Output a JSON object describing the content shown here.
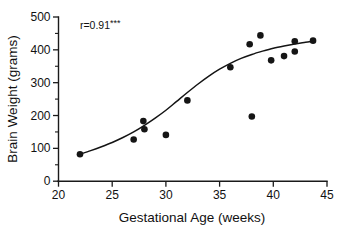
{
  "chart_data": {
    "type": "scatter",
    "title": "",
    "xlabel": "Gestational Age (weeks)",
    "ylabel": "Brain Weight (grams)",
    "xlim": [
      20,
      45
    ],
    "ylim": [
      0,
      500
    ],
    "xticks": [
      20,
      25,
      30,
      35,
      40,
      45
    ],
    "xtick_labels": [
      "20",
      "25",
      "30",
      "35",
      "40",
      "45"
    ],
    "yticks": [
      0,
      100,
      200,
      300,
      400,
      500
    ],
    "ytick_labels": [
      "0",
      "100",
      "200",
      "300",
      "400",
      "500"
    ],
    "y_minor_ticks": [
      50,
      150,
      250,
      350,
      450
    ],
    "x_minor_ticks": [],
    "grid": false,
    "legend": false,
    "annotations": [
      {
        "name": "correlation-annotation",
        "text": "r=0.91",
        "superscript": "***",
        "x": 22.0,
        "y": 462
      }
    ],
    "points": [
      {
        "x": 22.0,
        "y": 82
      },
      {
        "x": 27.0,
        "y": 127
      },
      {
        "x": 27.9,
        "y": 183
      },
      {
        "x": 28.0,
        "y": 158
      },
      {
        "x": 30.0,
        "y": 141
      },
      {
        "x": 32.0,
        "y": 246
      },
      {
        "x": 36.0,
        "y": 347
      },
      {
        "x": 37.8,
        "y": 417
      },
      {
        "x": 38.0,
        "y": 197
      },
      {
        "x": 38.8,
        "y": 444
      },
      {
        "x": 39.8,
        "y": 368
      },
      {
        "x": 41.0,
        "y": 381
      },
      {
        "x": 42.0,
        "y": 395
      },
      {
        "x": 42.0,
        "y": 426
      },
      {
        "x": 43.7,
        "y": 428
      }
    ],
    "fit_curve": {
      "name": "smoothed-fit-line",
      "x": [
        22.0,
        23.0,
        24.0,
        25.0,
        26.0,
        27.0,
        28.0,
        29.0,
        30.0,
        31.0,
        32.0,
        33.0,
        34.0,
        35.0,
        36.0,
        37.0,
        38.0,
        39.0,
        40.0,
        41.0,
        42.0,
        43.0,
        43.8
      ],
      "y": [
        82,
        93,
        105,
        118,
        133,
        150,
        170,
        192,
        216,
        243,
        270,
        296,
        320,
        341,
        359,
        374,
        386,
        396,
        405,
        412,
        418,
        423,
        427
      ]
    }
  },
  "figure": {
    "background_color": "#ffffff",
    "ink_color": "#151515"
  }
}
